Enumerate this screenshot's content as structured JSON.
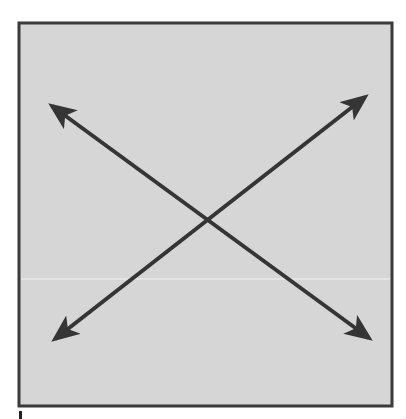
{
  "figure": {
    "type": "diagram",
    "colors": {
      "background": "#ffffff",
      "panel_fill": "#d6d6d6",
      "panel_border": "#3a3a3a",
      "arrow": "#353535",
      "seam_line": "#f2f2f2"
    },
    "panel": {
      "x": 19,
      "y": 23,
      "width": 373,
      "height": 383,
      "border_width": 3
    },
    "seam_y": 279,
    "arrows": [
      {
        "name": "arrow-topleft-bottomright",
        "x1": 52,
        "y1": 106,
        "x2": 369,
        "y2": 338,
        "double_headed": true
      },
      {
        "name": "arrow-bottomleft-topright",
        "x1": 55,
        "y1": 339,
        "x2": 365,
        "y2": 97,
        "double_headed": true
      }
    ],
    "footer_mark": {
      "x": 19,
      "y": 411,
      "width": 3,
      "height": 8
    }
  }
}
